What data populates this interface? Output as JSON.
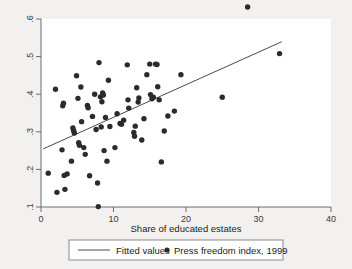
{
  "chart_data": {
    "type": "scatter",
    "title": "",
    "subtitle": "",
    "xlabel": "Share of educated estates",
    "ylabel": "",
    "xlim": [
      0,
      40
    ],
    "ylim": [
      0.1,
      0.6
    ],
    "xticks": [
      0,
      10,
      20,
      30,
      40
    ],
    "xtick_labels": [
      "0",
      "10",
      "20",
      "30",
      "40"
    ],
    "yticks": [
      0.1,
      0.2,
      0.3,
      0.4,
      0.5,
      0.6
    ],
    "ytick_labels": [
      ".1",
      ".2",
      ".3",
      ".4",
      ".5",
      ".6"
    ],
    "grid": false,
    "legend_position": "bottom",
    "series": [
      {
        "name": "Fitted values",
        "type": "line",
        "marker": "line",
        "color": "#4a4a4a",
        "x": [
          0.3,
          33.2
        ],
        "y": [
          0.2545,
          0.5395
        ]
      },
      {
        "name": "Press freedom index, 1999",
        "type": "scatter",
        "marker": "circle",
        "color": "#2b2b2b",
        "points": [
          [
            1.0,
            0.19
          ],
          [
            2.0,
            0.413
          ],
          [
            2.2,
            0.139
          ],
          [
            2.9,
            0.252
          ],
          [
            3.0,
            0.369
          ],
          [
            3.1,
            0.376
          ],
          [
            3.2,
            0.184
          ],
          [
            3.3,
            0.147
          ],
          [
            3.6,
            0.188
          ],
          [
            4.2,
            0.222
          ],
          [
            4.4,
            0.31
          ],
          [
            4.5,
            0.303
          ],
          [
            4.6,
            0.297
          ],
          [
            4.9,
            0.449
          ],
          [
            5.1,
            0.389
          ],
          [
            5.2,
            0.271
          ],
          [
            5.3,
            0.264
          ],
          [
            5.5,
            0.419
          ],
          [
            5.6,
            0.327
          ],
          [
            5.9,
            0.258
          ],
          [
            6.1,
            0.24
          ],
          [
            6.4,
            0.37
          ],
          [
            6.5,
            0.364
          ],
          [
            6.7,
            0.183
          ],
          [
            7.1,
            0.341
          ],
          [
            7.4,
            0.4
          ],
          [
            7.6,
            0.306
          ],
          [
            7.8,
            0.164
          ],
          [
            7.9,
            0.101
          ],
          [
            8.0,
            0.484
          ],
          [
            8.2,
            0.393
          ],
          [
            8.3,
            0.313
          ],
          [
            8.4,
            0.38
          ],
          [
            8.5,
            0.403
          ],
          [
            8.6,
            0.398
          ],
          [
            8.7,
            0.25
          ],
          [
            8.9,
            0.338
          ],
          [
            9.1,
            0.222
          ],
          [
            9.3,
            0.437
          ],
          [
            9.5,
            0.314
          ],
          [
            10.2,
            0.258
          ],
          [
            10.5,
            0.348
          ],
          [
            10.9,
            0.322
          ],
          [
            11.1,
            0.32
          ],
          [
            11.4,
            0.331
          ],
          [
            11.9,
            0.478
          ],
          [
            12.0,
            0.385
          ],
          [
            12.1,
            0.363
          ],
          [
            12.8,
            0.298
          ],
          [
            12.9,
            0.288
          ],
          [
            13.0,
            0.315
          ],
          [
            13.2,
            0.417
          ],
          [
            13.4,
            0.379
          ],
          [
            13.5,
            0.39
          ],
          [
            13.9,
            0.278
          ],
          [
            14.2,
            0.335
          ],
          [
            14.6,
            0.452
          ],
          [
            15.0,
            0.48
          ],
          [
            15.1,
            0.399
          ],
          [
            15.3,
            0.388
          ],
          [
            15.5,
            0.392
          ],
          [
            15.8,
            0.48
          ],
          [
            16.0,
            0.479
          ],
          [
            16.1,
            0.42
          ],
          [
            16.3,
            0.385
          ],
          [
            16.6,
            0.22
          ],
          [
            17.0,
            0.302
          ],
          [
            17.5,
            0.342
          ],
          [
            18.4,
            0.355
          ],
          [
            19.3,
            0.452
          ],
          [
            25.0,
            0.392
          ],
          [
            28.5,
            0.632
          ],
          [
            32.9,
            0.508
          ]
        ]
      }
    ],
    "legend": [
      {
        "label": "Fitted values",
        "marker": "line",
        "color": "#4a4a4a"
      },
      {
        "label": "Press freedom index, 1999",
        "marker": "circle",
        "color": "#2b2b2b"
      }
    ]
  },
  "axes": {
    "x_title": "Share of educated estates"
  }
}
